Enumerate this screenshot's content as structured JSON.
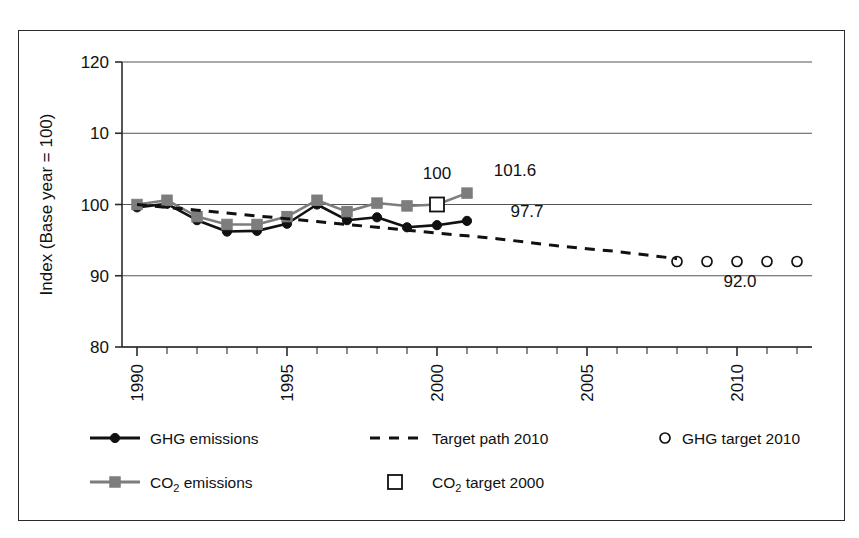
{
  "chart_data": {
    "type": "line",
    "title": "",
    "xlabel": "",
    "ylabel": "Index (Base year = 100)",
    "xlim": [
      1989.5,
      2012.5
    ],
    "ylim": [
      80,
      120
    ],
    "yticks": [
      80,
      90,
      100,
      110,
      120
    ],
    "ytick_labels": [
      "80",
      "90",
      "100",
      "10",
      "120"
    ],
    "xticks": [
      1990,
      1995,
      2000,
      2005,
      2010
    ],
    "xtick_labels": [
      "1990",
      "1995",
      "2000",
      "2005",
      "2010"
    ],
    "x_minor_ticks_every": 1,
    "grid": "horizontal",
    "legend_position": "bottom",
    "series": [
      {
        "name": "GHG emissions",
        "marker": "filled-circle",
        "line": "solid",
        "color": "#111111",
        "x": [
          1990,
          1991,
          1992,
          1993,
          1994,
          1995,
          1996,
          1997,
          1998,
          1999,
          2000,
          2001
        ],
        "values": [
          99.6,
          100.1,
          97.8,
          96.2,
          96.3,
          97.3,
          100.0,
          97.8,
          98.2,
          96.8,
          97.1,
          97.7
        ]
      },
      {
        "name": "CO2 emissions",
        "marker": "filled-square",
        "line": "solid",
        "color": "#7d7d7d",
        "x": [
          1990,
          1991,
          1992,
          1993,
          1994,
          1995,
          1996,
          1997,
          1998,
          1999,
          2000,
          2001
        ],
        "values": [
          100.0,
          100.6,
          98.3,
          97.2,
          97.2,
          98.3,
          100.6,
          99.0,
          100.2,
          99.8,
          100.0,
          101.6
        ]
      },
      {
        "name": "Target path 2010",
        "marker": "none",
        "line": "dashed",
        "color": "#111111",
        "x": [
          1990,
          1991,
          1992,
          1993,
          1994,
          1995,
          1996,
          1997,
          1998,
          1999,
          2000,
          2001,
          2002,
          2003,
          2004,
          2005,
          2006,
          2007,
          2008
        ],
        "values": [
          100.0,
          99.6,
          99.2,
          98.8,
          98.4,
          98.0,
          97.6,
          97.2,
          96.8,
          96.4,
          96.0,
          95.6,
          95.2,
          94.7,
          94.2,
          93.8,
          93.4,
          92.9,
          92.4
        ]
      },
      {
        "name": "CO2 target 2000",
        "marker": "open-square",
        "line": "none",
        "color": "#111111",
        "x": [
          2000
        ],
        "values": [
          100.0
        ]
      },
      {
        "name": "GHG target 2010",
        "marker": "open-circle",
        "line": "none",
        "color": "#111111",
        "x": [
          2008,
          2009,
          2010,
          2011,
          2012
        ],
        "values": [
          92.0,
          92.0,
          92.0,
          92.0,
          92.0
        ]
      }
    ],
    "annotations": [
      {
        "text": "100",
        "x": 2000,
        "y": 103.6,
        "anchor": "middle"
      },
      {
        "text": "101.6",
        "x": 2002.6,
        "y": 104.0,
        "anchor": "middle"
      },
      {
        "text": "97.7",
        "x": 2003.0,
        "y": 98.3,
        "anchor": "middle"
      },
      {
        "text": "92.0",
        "x": 2010.1,
        "y": 88.4,
        "anchor": "middle"
      }
    ]
  },
  "legend": {
    "entries": [
      {
        "id": "ghg-emissions",
        "label": "GHG emissions",
        "sub": "",
        "marker": "filled-circle",
        "line": "solid",
        "color": "#111111"
      },
      {
        "id": "target-path-2010",
        "label": "Target path 2010",
        "sub": "",
        "marker": "none",
        "line": "dashed",
        "color": "#111111"
      },
      {
        "id": "ghg-target-2010",
        "label": "GHG target 2010",
        "sub": "",
        "marker": "open-circle",
        "line": "none",
        "color": "#111111"
      },
      {
        "id": "co2-emissions",
        "label": "CO",
        "sub": "2",
        "label_tail": " emissions",
        "marker": "filled-square",
        "line": "solid",
        "color": "#7d7d7d"
      },
      {
        "id": "co2-target-2000",
        "label": "CO",
        "sub": "2",
        "label_tail": " target 2000",
        "marker": "open-square",
        "line": "none",
        "color": "#111111"
      }
    ]
  },
  "colors": {
    "ghg": "#111111",
    "co2": "#7d7d7d",
    "grid": "#555555",
    "axis": "#2b2b2b",
    "frame": "#2b2b2b",
    "background": "#ffffff"
  }
}
